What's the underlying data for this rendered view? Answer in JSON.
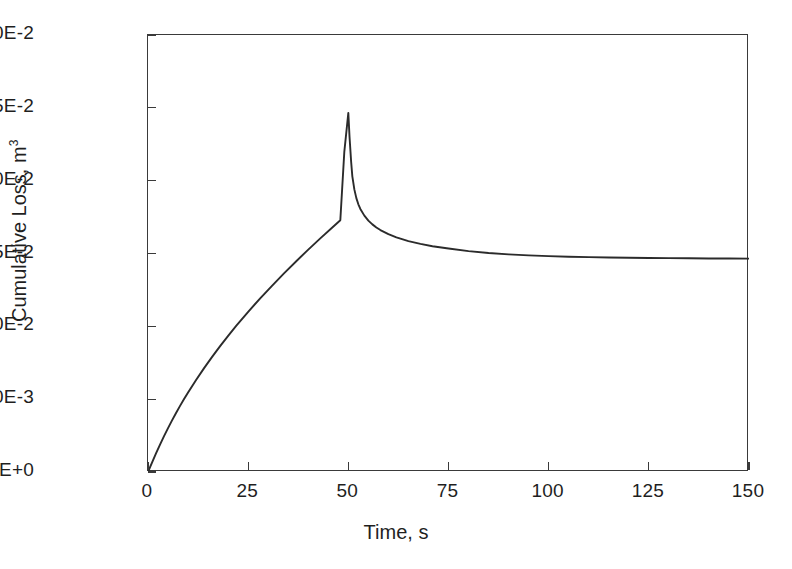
{
  "chart_data": {
    "type": "line",
    "title": "",
    "xlabel": "Time, s",
    "ylabel_text": "Cumulative Loss, m",
    "ylabel_superscript": "3",
    "xlim": [
      0,
      150
    ],
    "ylim": [
      0,
      0.03
    ],
    "grid": false,
    "legend": null,
    "xticks": [
      0,
      25,
      50,
      75,
      100,
      125,
      150
    ],
    "xtick_labels": [
      "0",
      "25",
      "50",
      "75",
      "100",
      "125",
      "150"
    ],
    "yticks": [
      0.0,
      0.005,
      0.01,
      0.015,
      0.02,
      0.025,
      0.03
    ],
    "ytick_labels": [
      "0.0E+0",
      "5.0E-3",
      "1.0E-2",
      "1.5E-2",
      "2.0E-2",
      "2.5E-2",
      "3.0E-2"
    ],
    "line_color": "#2b2b2b",
    "line_width": 1.9,
    "annotations": [],
    "series": [
      {
        "name": "Cumulative Loss",
        "x": [
          0,
          1,
          2,
          3,
          4,
          5,
          6,
          7,
          8,
          9,
          10,
          12,
          14,
          16,
          18,
          20,
          22,
          25,
          28,
          31,
          34,
          37,
          40,
          43,
          46,
          48,
          49,
          50,
          50.3,
          50.7,
          51,
          51.5,
          52,
          52.5,
          53,
          54,
          55,
          56,
          57,
          58,
          60,
          62,
          65,
          68,
          71,
          75,
          80,
          85,
          90,
          95,
          100,
          105,
          110,
          115,
          120,
          125,
          130,
          135,
          140,
          145,
          150
        ],
        "y": [
          0.0,
          0.00065,
          0.00128,
          0.00188,
          0.00246,
          0.00301,
          0.00354,
          0.00405,
          0.00454,
          0.00501,
          0.00546,
          0.00632,
          0.00713,
          0.0079,
          0.00864,
          0.00935,
          0.01003,
          0.011,
          0.01192,
          0.0128,
          0.01365,
          0.01447,
          0.01527,
          0.01604,
          0.01679,
          0.01728,
          0.022,
          0.02465,
          0.023,
          0.0213,
          0.0203,
          0.0194,
          0.0188,
          0.01838,
          0.01806,
          0.0176,
          0.01726,
          0.017,
          0.01679,
          0.01661,
          0.01633,
          0.01611,
          0.01585,
          0.01566,
          0.0155,
          0.01534,
          0.01516,
          0.01503,
          0.01494,
          0.01487,
          0.01482,
          0.01478,
          0.01475,
          0.01473,
          0.01471,
          0.01469,
          0.01468,
          0.01467,
          0.01466,
          0.01466,
          0.01465
        ]
      }
    ]
  }
}
